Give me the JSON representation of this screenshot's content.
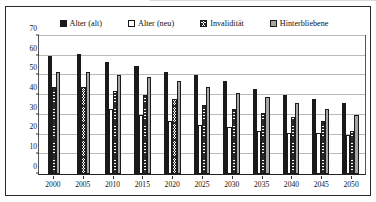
{
  "chart_data": {
    "type": "bar",
    "title": "",
    "subtitle": "",
    "xlabel": "",
    "ylabel": "",
    "categories": [
      "2000",
      "2005",
      "2010",
      "2015",
      "2020",
      "2025",
      "2030",
      "2035",
      "2040",
      "2045",
      "2050"
    ],
    "ylim": [
      0,
      70
    ],
    "ytick_step": 10,
    "yticks": [
      "0",
      "10",
      "20",
      "30",
      "40",
      "50",
      "60",
      "70"
    ],
    "grid": true,
    "legend_position": "top-center",
    "series": [
      {
        "name": "Alter (alt)",
        "pattern": "solid-black",
        "color": "#1a1a1a",
        "values": [
          60,
          61,
          57,
          55,
          52,
          50,
          47,
          43,
          40,
          38,
          36
        ]
      },
      {
        "name": "Alter (neu)",
        "pattern": "solid-white",
        "color": "#ffffff",
        "values": [
          0,
          0,
          33,
          30,
          27,
          25,
          24,
          22,
          21,
          21,
          20
        ]
      },
      {
        "name": "Invalidität",
        "pattern": "cross-hatch",
        "color": "#2b2b2b",
        "values": [
          44,
          44,
          42,
          40,
          38,
          35,
          33,
          31,
          29,
          27,
          22
        ]
      },
      {
        "name": "Hinterbliebene",
        "pattern": "solid-gray",
        "color": "#a6a6a6",
        "values": [
          52,
          52,
          50,
          49,
          47,
          44,
          41,
          39,
          36,
          33,
          30
        ]
      }
    ]
  },
  "legend": {
    "items": [
      {
        "label": "Alter (alt)",
        "swatch": "legend-swatch-solid-black"
      },
      {
        "label": "Alter (neu)",
        "swatch": "legend-swatch-white"
      },
      {
        "label": "Invalidität",
        "swatch": "legend-swatch-crosshatch"
      },
      {
        "label": "Hinterbliebene",
        "swatch": "legend-swatch-gray"
      }
    ]
  }
}
